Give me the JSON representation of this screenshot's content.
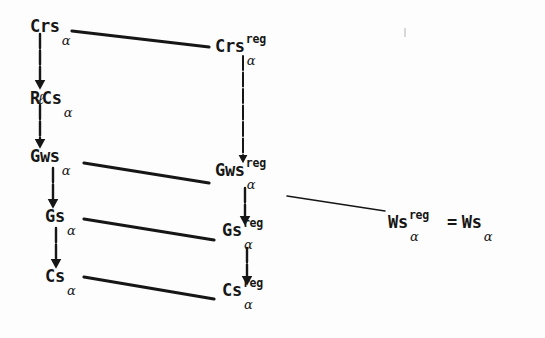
{
  "diagram": {
    "type": "commutative-lattice-diagram",
    "title": "",
    "background_color": "#fdfdfd",
    "ink_color": "#161616",
    "nodes": [
      {
        "id": "crs",
        "base": "Crs",
        "sup": "",
        "sub": "α",
        "x": 30,
        "y": 18
      },
      {
        "id": "rlcs",
        "base": "R",
        "ell": "ℓ",
        "base2": "Cs",
        "sup": "",
        "sub": "α",
        "x": 30,
        "y": 90
      },
      {
        "id": "gws",
        "base": "Gws",
        "sup": "",
        "sub": "α",
        "x": 30,
        "y": 148
      },
      {
        "id": "gs",
        "base": "Gs",
        "sup": "",
        "sub": "α",
        "x": 45,
        "y": 208
      },
      {
        "id": "cs",
        "base": "Cs",
        "sup": "",
        "sub": "α",
        "x": 45,
        "y": 268
      },
      {
        "id": "crs-reg",
        "base": "Crs",
        "sup": "reg",
        "sub": "α",
        "x": 215,
        "y": 38
      },
      {
        "id": "gws-reg",
        "base": "Gws",
        "sup": "reg",
        "sub": "α",
        "x": 215,
        "y": 162
      },
      {
        "id": "gs-reg",
        "base": "Gs",
        "sup": "reg",
        "sub": "α",
        "x": 222,
        "y": 222
      },
      {
        "id": "cs-reg",
        "base": "Cs",
        "sup": "reg",
        "sub": "α",
        "x": 222,
        "y": 282
      },
      {
        "id": "ws-eq",
        "base": "Ws",
        "sup": "reg",
        "sub": "α",
        "eq": "=",
        "base_right": "Ws",
        "sub_right": "α",
        "x": 388,
        "y": 214
      }
    ],
    "edges": [
      {
        "id": "e-crs-to-rlcs",
        "kind": "vertical-arrow",
        "from": "crs",
        "to": "rlcs",
        "x1": 40,
        "y1": 34,
        "x2": 40,
        "y2": 86,
        "width": 2.4
      },
      {
        "id": "e-rlcs-to-gws",
        "kind": "vertical-arrow",
        "from": "rlcs",
        "to": "gws",
        "x1": 40,
        "y1": 105,
        "x2": 40,
        "y2": 145,
        "width": 2.4
      },
      {
        "id": "e-gws-to-gs",
        "kind": "vertical-arrow",
        "from": "gws",
        "to": "gs",
        "x1": 53,
        "y1": 168,
        "x2": 53,
        "y2": 205,
        "width": 2.4
      },
      {
        "id": "e-gs-to-cs",
        "kind": "vertical-arrow",
        "from": "gs",
        "to": "cs",
        "x1": 56,
        "y1": 228,
        "x2": 56,
        "y2": 265,
        "width": 2.4
      },
      {
        "id": "e-crsreg-to-gwsreg",
        "kind": "vertical-arrow",
        "from": "crs-reg",
        "to": "gws-reg",
        "x1": 243,
        "y1": 56,
        "x2": 243,
        "y2": 160,
        "width": 2.0
      },
      {
        "id": "e-gwsreg-to-gsreg",
        "kind": "vertical-arrow",
        "from": "gws-reg",
        "to": "gs-reg",
        "x1": 245,
        "y1": 188,
        "x2": 245,
        "y2": 222,
        "width": 2.4
      },
      {
        "id": "e-gsreg-to-csreg",
        "kind": "vertical-arrow",
        "from": "gs-reg",
        "to": "cs-reg",
        "x1": 247,
        "y1": 248,
        "x2": 247,
        "y2": 282,
        "width": 2.4
      },
      {
        "id": "e-crs-to-crsreg",
        "kind": "diagonal",
        "from": "crs",
        "to": "crs-reg",
        "x1": 72,
        "y1": 31,
        "x2": 209,
        "y2": 47,
        "width": 3.2
      },
      {
        "id": "e-gws-to-gwsreg",
        "kind": "diagonal",
        "from": "gws",
        "to": "gws-reg",
        "x1": 84,
        "y1": 163,
        "x2": 209,
        "y2": 183,
        "width": 3.2
      },
      {
        "id": "e-gs-to-gsreg",
        "kind": "diagonal",
        "from": "gs",
        "to": "gs-reg",
        "x1": 84,
        "y1": 219,
        "x2": 214,
        "y2": 240,
        "width": 3.2
      },
      {
        "id": "e-cs-to-csreg",
        "kind": "diagonal",
        "from": "cs",
        "to": "cs-reg",
        "x1": 84,
        "y1": 277,
        "x2": 214,
        "y2": 299,
        "width": 3.2
      },
      {
        "id": "e-gwsreg-to-wsreg",
        "kind": "diagonal-thin",
        "from": "gws-reg",
        "to": "ws-eq",
        "x1": 287,
        "y1": 196,
        "x2": 385,
        "y2": 211,
        "width": 1.5
      }
    ],
    "artifacts": [
      {
        "id": "scan-speckle-top-right",
        "x": 404,
        "y": 28,
        "width": 2,
        "height": 9
      }
    ]
  }
}
